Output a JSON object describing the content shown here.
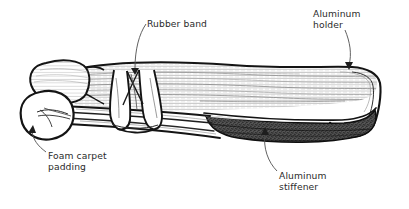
{
  "figure": {
    "type": "line-drawing-illustration",
    "background_color": "#ffffff",
    "ink_color": "#1a1a1a",
    "label_color": "#2b2b2b",
    "shading_color": "#4a4a4a",
    "callouts": [
      {
        "id": "rubber-band",
        "label": "Rubber band",
        "text_x": 147,
        "text_y": 18,
        "leader": {
          "from_x": 150,
          "from_y": 31,
          "to_x": 136,
          "to_y": 71
        }
      },
      {
        "id": "aluminum-holder",
        "label": "Aluminum\nholder",
        "text_x": 313,
        "text_y": 8,
        "leader": {
          "from_x": 344,
          "top_y": 30,
          "to_x": 352,
          "to_y": 68
        }
      },
      {
        "id": "foam-carpet-padding",
        "label": "Foam carpet\npadding",
        "text_x": 48,
        "text_y": 150,
        "leader": {
          "from_x": 46,
          "from_y": 152,
          "to_x": 33,
          "to_y": 128
        }
      },
      {
        "id": "aluminum-stiffener",
        "label": "Aluminum\nstiffener",
        "text_x": 279,
        "text_y": 170,
        "leader": {
          "from_x": 277,
          "from_y": 171,
          "to_x": 266,
          "to_y": 130
        }
      }
    ],
    "parts": [
      {
        "id": "foam-roll",
        "name": "Foam carpet padding roll (left end)"
      },
      {
        "id": "strap-body",
        "name": "Hatched aluminum holder strap body"
      },
      {
        "id": "rubber-band-wrap",
        "name": "Rubber band wrapped around strap"
      },
      {
        "id": "stiffener-shading",
        "name": "Dark shaded aluminum stiffener underside"
      },
      {
        "id": "right-fold",
        "name": "Rounded folded right end of strap"
      }
    ]
  }
}
